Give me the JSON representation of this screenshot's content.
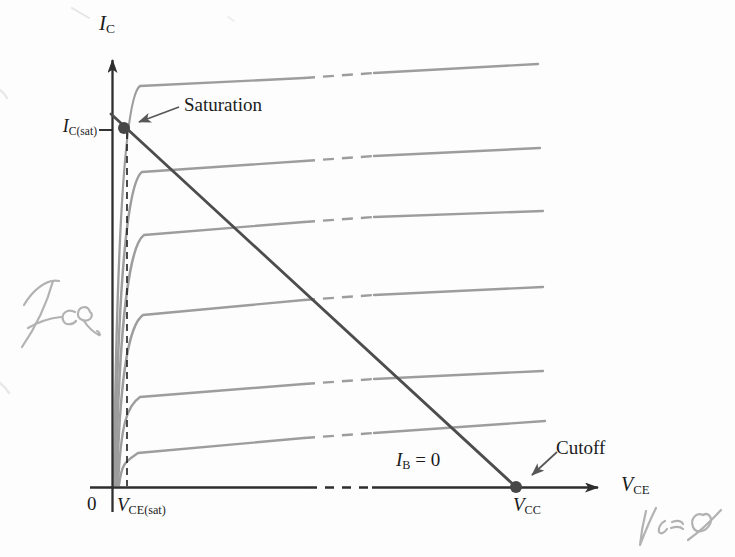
{
  "labels": {
    "y_axis": {
      "base": "I",
      "sub": "C"
    },
    "x_axis": {
      "base": "V",
      "sub": "CE"
    },
    "ic_sat": {
      "base": "I",
      "sub": "C(sat)"
    },
    "vce_sat": {
      "base": "V",
      "sub": "CE(sat)"
    },
    "vcc": {
      "base": "V",
      "sub": "CC"
    },
    "ib_zero": {
      "base": "I",
      "sub": "B",
      "suffix": " = 0"
    },
    "saturation": "Saturation",
    "cutoff": "Cutoff",
    "origin": "0",
    "handwritten_left": "IcQ",
    "handwritten_bottom_right": "VceQ"
  },
  "colors": {
    "axis": "#2e2e2e",
    "curve": "#9d9d9d",
    "load_line": "#4d4d4d",
    "dot": "#474747",
    "annotation_arrow": "#575757",
    "dashed_guide": "#1e1e1e",
    "handwriting": "#b2b2b2",
    "background": "#fdfdfd"
  },
  "figure": {
    "canvas": {
      "w": 735,
      "h": 557
    },
    "axes": {
      "origin_x": 112.5,
      "axis_y": 487.5,
      "y_top": 60,
      "y_bottom": 512,
      "x_left": 90,
      "x_right": 598,
      "x_dash": [
        308,
        372
      ]
    },
    "curves": {
      "start_y": 485,
      "dash_x": [
        304,
        374
      ],
      "list": [
        {
          "start_x": 114,
          "knee": [
            136,
            86
          ],
          "dash_y": [
            78,
            73
          ],
          "end": [
            538,
            64
          ]
        },
        {
          "start_x": 115,
          "knee": [
            138,
            172
          ],
          "dash_y": [
            161,
            156
          ],
          "end": [
            540,
            148
          ]
        },
        {
          "start_x": 116,
          "knee": [
            140,
            235
          ],
          "dash_y": [
            222,
            217
          ],
          "end": [
            543,
            211
          ]
        },
        {
          "start_x": 117,
          "knee": [
            139,
            315
          ],
          "dash_y": [
            300,
            295
          ],
          "end": [
            543,
            287
          ]
        },
        {
          "start_x": 118,
          "knee": [
            136,
            397
          ],
          "dash_y": [
            384,
            379
          ],
          "end": [
            543,
            371
          ]
        },
        {
          "start_x": 119,
          "knee": [
            134,
            453
          ],
          "dash_y": [
            438,
            433
          ],
          "end": [
            545,
            421
          ]
        }
      ]
    },
    "load_line": {
      "x1": 111,
      "y1": 114,
      "x2": 516,
      "y2": 487
    },
    "sat_dot": [
      124,
      128
    ],
    "cutoff_dot": [
      516,
      487
    ],
    "dot_r": 6,
    "dashed_drop": {
      "x": 127,
      "y1": 132,
      "y2": 486
    },
    "ic_sat_tick": {
      "x1": 99,
      "x2": 112,
      "y": 130
    },
    "sat_arrow": {
      "x1": 179,
      "y1": 107,
      "x2": 139,
      "y2": 122
    },
    "cutoff_arrow": {
      "x1": 557,
      "y1": 452,
      "x2": 532,
      "y2": 475
    }
  }
}
